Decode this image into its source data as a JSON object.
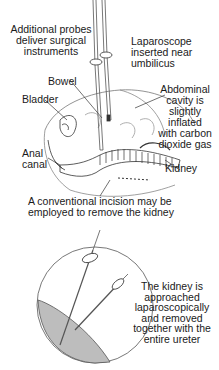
{
  "diagram": {
    "top_panel": {
      "labels": {
        "probes": "Additional probes\ndeliver surgical\ninstruments",
        "laparoscope": "Laparoscope\ninserted near\numbilicus",
        "bowel": "Bowel",
        "bladder": "Bladder",
        "abdominal_cavity": "Abdominal\ncavity is\nslightly\ninflated\nwith carbon\ndioxide gas",
        "anal_canal": "Anal\ncanal",
        "kidney": "Kidney",
        "incision": "A conventional incision may be\nemployed to remove the kidney"
      }
    },
    "bottom_panel": {
      "labels": {
        "approach": "The kidney is\napproached\nlaparoscopically\nand removed\ntogether with the\nentire ureter"
      }
    },
    "colors": {
      "line": "#333333",
      "shading": "#bdbdbd"
    }
  }
}
